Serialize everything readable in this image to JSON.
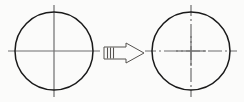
{
  "diagram": {
    "background_color": "#fbfbfa",
    "ink_color": "#1a1a1a",
    "centerline_color": "#6e6e6e",
    "arrow_color": "#55524f",
    "arrow_fill": "#fbfbfa",
    "left": {
      "label": "Circle with continuous crosshair centerlines",
      "shape": "circle",
      "center_x": 54,
      "center_y": 51,
      "radius": 39,
      "stroke_width": 1.5,
      "centerline_style": "solid",
      "centerline_overhang": 7,
      "vertical_label": "vertical-centerline-solid",
      "horizontal_label": "horizontal-centerline-solid"
    },
    "right": {
      "label": "Circle with dash-dot centerlines",
      "shape": "circle",
      "center_x": 191,
      "center_y": 51,
      "radius": 39,
      "stroke_width": 1.5,
      "centerline_style": "dash-dot",
      "centerline_overhang": 7,
      "dash_pattern": "14 3 2 3",
      "vertical_label": "vertical-centerline-dashdot",
      "horizontal_label": "horizontal-centerline-dashdot"
    },
    "arrow": {
      "label": "conversion-arrow",
      "direction": "right",
      "x": 104,
      "y": 43,
      "width": 40,
      "height": 20,
      "stripe_count": 3,
      "stroke_width": 1
    }
  }
}
